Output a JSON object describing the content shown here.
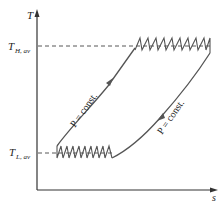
{
  "diagram": {
    "type": "T-s diagram (Ericsson-like cycle with multistage compression/expansion)",
    "axes": {
      "y_label": "T",
      "x_label": "s"
    },
    "levels": {
      "high": {
        "label_main": "T",
        "label_sub": "H, av"
      },
      "low": {
        "label_main": "T",
        "label_sub": "L, av"
      }
    },
    "curves": {
      "left": {
        "label": "P = const.",
        "direction": "up"
      },
      "right": {
        "label": "P = const.",
        "direction": "down"
      }
    },
    "zigzags": {
      "top": {
        "teeth": 9,
        "description": "multistage expansion with reheating at T_H,av"
      },
      "bottom": {
        "teeth": 9,
        "description": "multistage compression with intercooling at T_L,av"
      }
    },
    "colors": {
      "curve": "#555555",
      "axis": "#333333",
      "background": "#ffffff"
    }
  }
}
